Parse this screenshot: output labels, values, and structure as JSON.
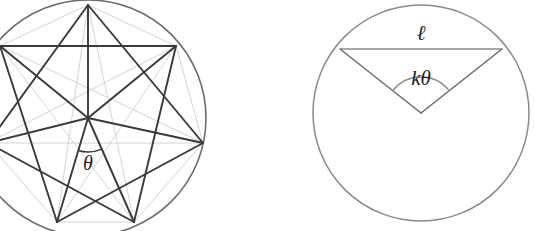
{
  "figure": {
    "background_color": "#ffffff",
    "stroke_dark": "#3a3a3a",
    "stroke_mid": "#6b6b6b",
    "stroke_faint": "#cfcfcf",
    "label_color": "#1d1d1d"
  },
  "left_diagram": {
    "name": "star-polygon-circle",
    "circle": {
      "cx": 88,
      "cy": 118,
      "r": 118
    },
    "vertex_count": 7,
    "star_step": 2,
    "vertices": [
      {
        "id": "v0",
        "x": 88,
        "y": 5,
        "label": ""
      },
      {
        "id": "v1",
        "x": 176,
        "y": 46,
        "label": ""
      },
      {
        "id": "v2",
        "x": 203,
        "y": 143,
        "label": ""
      },
      {
        "id": "v3",
        "x": 134,
        "y": 222,
        "label": ""
      },
      {
        "id": "v4",
        "x": 57,
        "y": 222,
        "label": ""
      },
      {
        "id": "v5",
        "x": -12,
        "y": 143,
        "label": ""
      },
      {
        "id": "v6",
        "x": 0,
        "y": 46,
        "label": ""
      }
    ],
    "angle_label": {
      "text": "θ",
      "x": 88,
      "y": 170,
      "font_size": 20,
      "arc_radius": 34
    },
    "center_marker": {
      "x": 88,
      "y": 118
    }
  },
  "right_diagram": {
    "name": "chord-angle-circle",
    "circle": {
      "cx": 421,
      "cy": 113,
      "r": 108
    },
    "chord": {
      "x1": 340,
      "y1": 49,
      "x2": 502,
      "y2": 49,
      "label": "ℓ",
      "label_x": 421,
      "label_y": 40,
      "label_font_size": 21
    },
    "radii": [
      {
        "x1": 421,
        "y1": 113,
        "x2": 340,
        "y2": 49
      },
      {
        "x1": 421,
        "y1": 113,
        "x2": 502,
        "y2": 49
      }
    ],
    "angle_label": {
      "text": "kθ",
      "x": 421,
      "y": 85,
      "font_size": 21,
      "arc_radius": 36
    },
    "center_marker": {
      "x": 421,
      "y": 113
    }
  }
}
